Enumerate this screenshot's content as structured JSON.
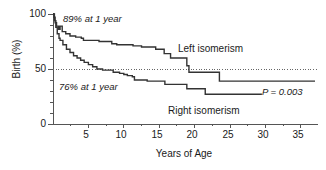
{
  "chart_data": {
    "type": "line",
    "subtype": "kaplan-meier-step",
    "title": "",
    "xlabel": "Years of Age",
    "ylabel": "Birth (%)",
    "xlim": [
      0,
      37
    ],
    "ylim": [
      0,
      100
    ],
    "xticks": [
      0,
      5,
      10,
      15,
      20,
      25,
      30,
      35
    ],
    "xtick_labels": [
      "0",
      "5",
      "10",
      "15",
      "20",
      "25",
      "30",
      "35"
    ],
    "xticks_minor": [
      2.5,
      7.5,
      12.5,
      17.5,
      22.5,
      27.5,
      32.5
    ],
    "yticks": [
      0,
      50,
      100
    ],
    "ytick_labels": [
      "0",
      "50",
      "100"
    ],
    "yticks_minor": [
      10,
      20,
      30,
      40,
      60,
      70,
      80,
      90
    ],
    "grid": false,
    "reference_lines": [
      {
        "name": "fifty-percent-line",
        "axis": "y",
        "value": 50,
        "style": "dotted"
      }
    ],
    "legend_position": "inline-annotation",
    "series": [
      {
        "name": "Left isomerism",
        "label_x": 23.5,
        "label_y": 62,
        "color": "#333333",
        "points": [
          [
            0.0,
            100
          ],
          [
            0.15,
            97
          ],
          [
            0.3,
            92
          ],
          [
            0.5,
            89
          ],
          [
            0.8,
            86
          ],
          [
            1.0,
            89
          ],
          [
            1.3,
            84
          ],
          [
            1.8,
            82
          ],
          [
            2.4,
            80
          ],
          [
            3.2,
            79
          ],
          [
            4.0,
            78
          ],
          [
            4.3,
            76
          ],
          [
            6.2,
            76
          ],
          [
            6.5,
            75
          ],
          [
            8.0,
            75
          ],
          [
            8.3,
            73
          ],
          [
            9.0,
            72
          ],
          [
            11.0,
            72
          ],
          [
            11.3,
            71
          ],
          [
            12.2,
            71
          ],
          [
            12.5,
            70
          ],
          [
            14.2,
            70
          ],
          [
            14.5,
            68
          ],
          [
            15.4,
            68
          ],
          [
            15.7,
            64
          ],
          [
            16.3,
            64
          ],
          [
            16.6,
            60
          ],
          [
            18.6,
            60
          ],
          [
            18.9,
            53
          ],
          [
            19.2,
            47
          ],
          [
            23.2,
            47
          ],
          [
            23.5,
            39
          ],
          [
            37.0,
            39
          ]
        ]
      },
      {
        "name": "Right isomerism",
        "label_x": 20.0,
        "label_y": 18,
        "color": "#333333",
        "points": [
          [
            0.0,
            100
          ],
          [
            0.2,
            94
          ],
          [
            0.4,
            88
          ],
          [
            0.6,
            82
          ],
          [
            0.85,
            78
          ],
          [
            1.0,
            76
          ],
          [
            1.4,
            72
          ],
          [
            1.9,
            68
          ],
          [
            2.4,
            65
          ],
          [
            2.9,
            62
          ],
          [
            3.4,
            60
          ],
          [
            3.9,
            58
          ],
          [
            4.4,
            56
          ],
          [
            5.0,
            54
          ],
          [
            5.6,
            52
          ],
          [
            6.2,
            50
          ],
          [
            7.0,
            49
          ],
          [
            8.2,
            49
          ],
          [
            8.5,
            47
          ],
          [
            9.4,
            46
          ],
          [
            10.0,
            45
          ],
          [
            10.5,
            44
          ],
          [
            11.2,
            43
          ],
          [
            11.5,
            40
          ],
          [
            13.0,
            40
          ],
          [
            13.3,
            39
          ],
          [
            15.5,
            39
          ],
          [
            15.8,
            36
          ],
          [
            18.6,
            36
          ],
          [
            18.9,
            32
          ],
          [
            21.2,
            32
          ],
          [
            21.5,
            27
          ],
          [
            29.5,
            27
          ]
        ]
      }
    ],
    "annotations": [
      {
        "name": "left-one-year-annotation",
        "text": "89% at 1 year",
        "x": 3.0,
        "y": 93
      },
      {
        "name": "right-one-year-annotation",
        "text": "76% at 1 year",
        "x": 2.5,
        "y": 30
      },
      {
        "name": "p-value-annotation",
        "text": "P = 0.003",
        "x": 31.0,
        "y": 33
      }
    ]
  },
  "axes": {
    "y_title": "Birth (%)",
    "x_title": "Years of Age",
    "y_labels": [
      "100",
      "50",
      "0"
    ],
    "x_labels": [
      "0",
      "5",
      "10",
      "15",
      "20",
      "25",
      "30",
      "35"
    ]
  },
  "labels": {
    "left_series": "Left isomerism",
    "right_series": "Right isomerism",
    "left_annotation": "89% at 1 year",
    "right_annotation": "76% at 1 year",
    "pvalue": "P = 0.003"
  },
  "colors": {
    "curve": "#333333",
    "axis": "#555555",
    "text": "#1a1a1a",
    "reference_line": "#666666",
    "background": "#ffffff"
  }
}
